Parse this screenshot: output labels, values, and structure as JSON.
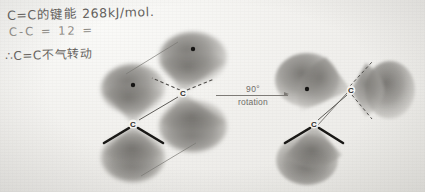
{
  "page": {
    "background_color": "#f2f1ee",
    "ink_color": "#6d6a66",
    "orbital_color": "#8a8884"
  },
  "handwritten_notes": {
    "line1": "C=C的键能 268kJ/mol.",
    "line2": "C-C   =    12  =",
    "line3": "∴C=C不气转动"
  },
  "transition": {
    "angle_label": "90°",
    "caption": "rotation"
  },
  "diagrams": [
    {
      "name": "p-orbital-overlap-before",
      "atoms": [
        {
          "label": "C",
          "x": 183,
          "y": 93
        },
        {
          "label": "C",
          "x": 133,
          "y": 124
        }
      ],
      "electron_dots": [
        {
          "x": 193,
          "y": 49
        },
        {
          "x": 133,
          "y": 85
        }
      ]
    },
    {
      "name": "p-orbital-overlap-after",
      "atoms": [
        {
          "label": "C",
          "x": 351,
          "y": 90
        },
        {
          "label": "C",
          "x": 314,
          "y": 124
        }
      ],
      "electron_dots": [
        {
          "x": 307,
          "y": 89
        }
      ]
    }
  ]
}
